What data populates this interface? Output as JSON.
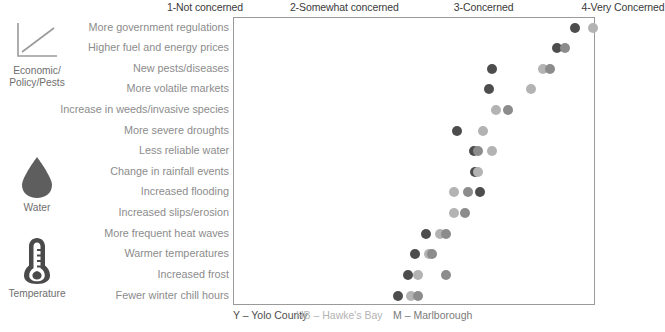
{
  "chart_data": {
    "type": "scatter",
    "title": "",
    "xlabel": "",
    "ylabel": "",
    "xlim": [
      1,
      4
    ],
    "grid": false,
    "legend_position": "bottom",
    "x_tick_values": [
      1,
      2,
      3,
      4
    ],
    "x_tick_labels": [
      "1-Not concerned",
      "2-Somewhat concerned",
      "3-Concerned",
      "4-Very Concerned"
    ],
    "categories": [
      "More government regulations",
      "Higher fuel and energy prices",
      "New pests/diseases",
      "More volatile markets",
      "Increase in weeds/invasive species",
      "More severe droughts",
      "Less reliable water",
      "Change in rainfall events",
      "Increased flooding",
      "Increased slips/erosion",
      "More frequent heat waves",
      "Warmer temperatures",
      "Increased frost",
      "Fewer winter chill hours"
    ],
    "series": [
      {
        "name": "Y",
        "full_name": "Yolo County",
        "color": "#4d4d4d",
        "values": [
          3.65,
          3.52,
          3.05,
          3.03,
          null,
          2.8,
          2.92,
          2.93,
          2.97,
          null,
          2.58,
          2.5,
          2.45,
          2.38
        ]
      },
      {
        "name": "HB",
        "full_name": "Hawke's Bay",
        "color": "#b3b3b3",
        "values": [
          3.78,
          null,
          3.42,
          3.33,
          3.08,
          2.99,
          3.05,
          2.95,
          2.78,
          2.78,
          2.68,
          2.6,
          2.52,
          2.47
        ]
      },
      {
        "name": "M",
        "full_name": "Marlborough",
        "color": "#8c8c8c",
        "values": [
          null,
          3.58,
          3.47,
          null,
          3.17,
          null,
          2.95,
          null,
          2.88,
          2.86,
          2.72,
          2.62,
          2.72,
          2.52
        ]
      }
    ],
    "groups": [
      {
        "name": "Economic/\nPolicy/Pests",
        "icon": "line-chart-icon",
        "rows": [
          0,
          1,
          2,
          3,
          4
        ]
      },
      {
        "name": "Water",
        "icon": "water-drop-icon",
        "rows": [
          5,
          6,
          7,
          8,
          9
        ]
      },
      {
        "name": "Temperature",
        "icon": "thermometer-icon",
        "rows": [
          10,
          11,
          12,
          13
        ]
      }
    ]
  },
  "groups": [
    {
      "label_line1": "Economic/",
      "label_line2": "Policy/Pests",
      "icon": "line-chart-icon"
    },
    {
      "label_line1": "Water",
      "label_line2": "",
      "icon": "water-drop-icon"
    },
    {
      "label_line1": "Temperature",
      "label_line2": "",
      "icon": "thermometer-icon"
    }
  ],
  "legend": {
    "entries": [
      {
        "text": "Y – Yolo County",
        "color": "#4d4d4d"
      },
      {
        "text": "HB – Hawke's Bay",
        "color": "#b3b3b3"
      },
      {
        "text": "M – Marlborough",
        "color": "#8c8c8c"
      }
    ]
  },
  "colors": {
    "yolo": "#4d4d4d",
    "hawkes_bay": "#b3b3b3",
    "marlborough": "#8c8c8c",
    "frame": "#9a9a9a",
    "label_text": "#8c8c8c",
    "axis_text": "#3a3a3a"
  }
}
